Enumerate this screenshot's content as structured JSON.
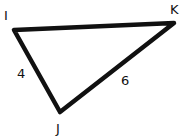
{
  "diagram": {
    "type": "triangle",
    "vertices": [
      {
        "name": "I",
        "x": 14,
        "y": 30,
        "label_x": 4,
        "label_y": 20
      },
      {
        "name": "K",
        "x": 174,
        "y": 23,
        "label_x": 170,
        "label_y": 14
      },
      {
        "name": "J",
        "x": 60,
        "y": 112,
        "label_x": 56,
        "label_y": 133
      }
    ],
    "sides": [
      {
        "from": "I",
        "to": "J",
        "length_label": "4",
        "label_x": 17,
        "label_y": 78
      },
      {
        "from": "J",
        "to": "K",
        "length_label": "6",
        "label_x": 121,
        "label_y": 85
      },
      {
        "from": "I",
        "to": "K",
        "length_label": ""
      }
    ],
    "stroke_color": "#111111"
  }
}
